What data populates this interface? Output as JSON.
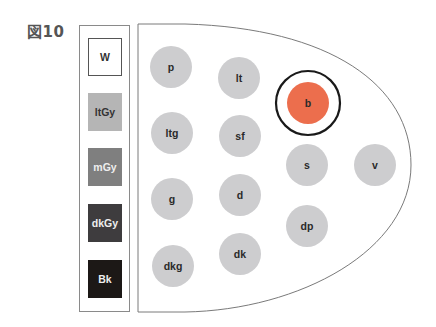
{
  "figure": {
    "label": "図10"
  },
  "legend": {
    "items": [
      {
        "key": "W",
        "fill": "#ffffff",
        "text_color": "#333333",
        "border": "#555555"
      },
      {
        "key": "ltGy",
        "fill": "#b5b5b5",
        "text_color": "#333333",
        "border": "none"
      },
      {
        "key": "mGy",
        "fill": "#7f7f7f",
        "text_color": "#eeeeee",
        "border": "none"
      },
      {
        "key": "dkGy",
        "fill": "#3e3c3e",
        "text_color": "#eeeeee",
        "border": "none"
      },
      {
        "key": "Bk",
        "fill": "#1c1816",
        "text_color": "#eeeeee",
        "border": "none"
      }
    ]
  },
  "tone_map": {
    "nodes": [
      {
        "id": "p",
        "label": "p",
        "cx": 171,
        "cy": 67,
        "fill": "#cdcdcf"
      },
      {
        "id": "lt",
        "label": "lt",
        "cx": 239,
        "cy": 78,
        "fill": "#cdcdcf"
      },
      {
        "id": "b",
        "label": "b",
        "cx": 308,
        "cy": 103,
        "fill": "#ec6e4d",
        "highlighted": true
      },
      {
        "id": "ltg",
        "label": "ltg",
        "cx": 172,
        "cy": 133,
        "fill": "#cdcdcf"
      },
      {
        "id": "sf",
        "label": "sf",
        "cx": 240,
        "cy": 136,
        "fill": "#cdcdcf"
      },
      {
        "id": "s",
        "label": "s",
        "cx": 307,
        "cy": 165,
        "fill": "#cdcdcf"
      },
      {
        "id": "v",
        "label": "v",
        "cx": 375,
        "cy": 165,
        "fill": "#cdcdcf"
      },
      {
        "id": "g",
        "label": "g",
        "cx": 172,
        "cy": 199,
        "fill": "#cdcdcf"
      },
      {
        "id": "d",
        "label": "d",
        "cx": 240,
        "cy": 195,
        "fill": "#cdcdcf"
      },
      {
        "id": "dp",
        "label": "dp",
        "cx": 307,
        "cy": 226,
        "fill": "#cdcdcf"
      },
      {
        "id": "dkg",
        "label": "dkg",
        "cx": 173,
        "cy": 266,
        "fill": "#cdcdcf"
      },
      {
        "id": "dk",
        "label": "dk",
        "cx": 240,
        "cy": 254,
        "fill": "#cdcdcf"
      }
    ],
    "node_radius": 21,
    "highlight_ring": {
      "radius": 32,
      "stroke": "#1a1a1a"
    },
    "outline_color": "#7a7a7a"
  }
}
